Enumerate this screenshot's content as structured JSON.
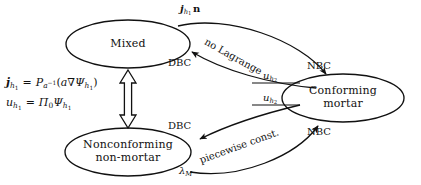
{
  "diagram": {
    "stroke_color": "#111111",
    "background_color": "#ffffff",
    "nodes": [
      {
        "id": "mixed",
        "label_line1": "Mixed",
        "label_line2": ""
      },
      {
        "id": "conforming",
        "label_line1": "Conforming",
        "label_line2": "mortar"
      },
      {
        "id": "nonconforming",
        "label_line1": "Nonconforming",
        "label_line2": "non-mortar"
      }
    ],
    "edge_labels": {
      "flux_normal": {
        "base": "j",
        "sub": "h",
        "subsub": "1",
        "tail": "n"
      },
      "no_lagrange": "no Lagrange",
      "piecewise_const": "piecewise const.",
      "dbc_top": "DBC",
      "dbc_bottom": "DBC",
      "nbc_top": "NBC",
      "nbc_bottom": "NBC",
      "u_h2_upper": {
        "base": "u",
        "sub": "h",
        "subsub": "2"
      },
      "u_h2_lower": {
        "base": "u",
        "sub": "h",
        "subsub": "2"
      },
      "lambda_m": {
        "base": "λ",
        "sub": "M"
      }
    },
    "formula_block": {
      "line1": {
        "lhs_base": "j",
        "lhs_sub": "h",
        "lhs_subsub": "1",
        "eq": "=",
        "rhs_base": "P",
        "rhs_sub": "a",
        "rhs_sup": "−1",
        "open": "(",
        "coef": "a",
        "nabla": "∇",
        "psi_base": "Ψ",
        "psi_sub": "h",
        "psi_subsub": "1",
        "close": ")"
      },
      "line2": {
        "lhs_base": "u",
        "lhs_sub": "h",
        "lhs_subsub": "1",
        "eq": "=",
        "pi_base": "Π",
        "pi_sub": "0",
        "psi_base": "Ψ",
        "psi_sub": "h",
        "psi_subsub": "1"
      }
    },
    "connectors": {
      "bidirectional_vertical": "double-headed hollow arrow between Mixed and Nonconforming non-mortar"
    }
  }
}
